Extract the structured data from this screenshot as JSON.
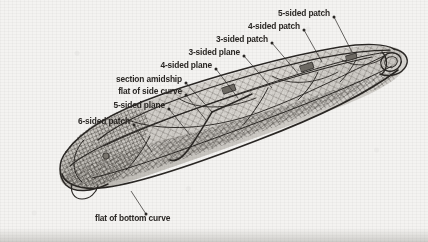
{
  "figure": {
    "background_color": "#f4f3f1",
    "ink_color": "#2a2724",
    "view": "three-quarter perspective, stern at lower-left, bow at upper-right"
  },
  "labels": [
    {
      "id": "five-sided-patch",
      "text": "5-sided patch",
      "x": 330,
      "y": 14,
      "align": "right",
      "dot": [
        334,
        17
      ],
      "leader_to": [
        352,
        52
      ]
    },
    {
      "id": "four-sided-patch",
      "text": "4-sided patch",
      "x": 300,
      "y": 27,
      "align": "right",
      "dot": [
        304,
        30
      ],
      "leader_to": [
        322,
        62
      ]
    },
    {
      "id": "three-sided-patch",
      "text": "3-sided patch",
      "x": 268,
      "y": 40,
      "align": "right",
      "dot": [
        272,
        43
      ],
      "leader_to": [
        300,
        76
      ]
    },
    {
      "id": "three-sided-plane",
      "text": "3-sided plane",
      "x": 240,
      "y": 53,
      "align": "right",
      "dot": [
        244,
        56
      ],
      "leader_to": [
        272,
        88
      ]
    },
    {
      "id": "four-sided-plane",
      "text": "4-sided plane",
      "x": 212,
      "y": 66,
      "align": "right",
      "dot": [
        216,
        69
      ],
      "leader_to": [
        238,
        98
      ]
    },
    {
      "id": "section-amidship",
      "text": "section amidship",
      "x": 182,
      "y": 80,
      "align": "right",
      "dot": [
        186,
        83
      ],
      "leader_to": [
        212,
        112
      ]
    },
    {
      "id": "flat-of-side-curve",
      "text": "flat of side curve",
      "x": 182,
      "y": 92,
      "align": "right",
      "dot": [
        186,
        95
      ],
      "leader_to": [
        206,
        120
      ]
    },
    {
      "id": "five-sided-plane",
      "text": "5-sided plane",
      "x": 165,
      "y": 106,
      "align": "right",
      "dot": [
        169,
        109
      ],
      "leader_to": [
        190,
        135
      ]
    },
    {
      "id": "six-sided-patch",
      "text": "6-sided patch",
      "x": 130,
      "y": 122,
      "align": "right",
      "dot": [
        134,
        125
      ],
      "leader_to": [
        152,
        152
      ]
    },
    {
      "id": "flat-of-bottom-curve",
      "text": "flat of bottom curve",
      "x": 95,
      "y": 218,
      "align": "left",
      "dot": [
        146,
        214
      ],
      "leader_to": [
        131,
        191
      ]
    }
  ]
}
